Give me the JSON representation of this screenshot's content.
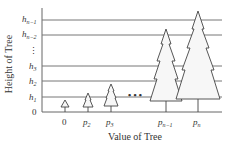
{
  "diagram": {
    "y_axis_label": "Height of Tree",
    "x_axis_label": "Value of Tree",
    "y_ticks": [
      {
        "base": "h",
        "sub": "n−1",
        "y": 20
      },
      {
        "base": "h",
        "sub": "n−2",
        "y": 35
      },
      {
        "base": "⋮",
        "sub": "",
        "y": 51
      },
      {
        "base": "h",
        "sub": "3",
        "y": 66
      },
      {
        "base": "h",
        "sub": "2",
        "y": 81
      },
      {
        "base": "h",
        "sub": "1",
        "y": 97
      },
      {
        "base": "0",
        "sub": "",
        "y": 112
      }
    ],
    "x_ticks": [
      {
        "base": "0",
        "sub": ""
      },
      {
        "base": "p",
        "sub": "2"
      },
      {
        "base": "p",
        "sub": "3"
      },
      {
        "base": "p",
        "sub": "n−1"
      },
      {
        "base": "p",
        "sub": "n"
      }
    ],
    "ellipsis": "• • •",
    "trees": [
      {
        "name": "tree-0",
        "tiers": 1,
        "top_y": 100
      },
      {
        "name": "tree-p2",
        "tiers": 2,
        "top_y": 93
      },
      {
        "name": "tree-p3",
        "tiers": 3,
        "top_y": 84
      },
      {
        "name": "tree-pn-1",
        "tiers": 4,
        "top_y": 29
      },
      {
        "name": "tree-pn",
        "tiers": 4,
        "top_y": 11
      }
    ]
  }
}
